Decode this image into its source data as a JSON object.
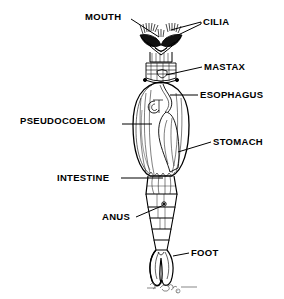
{
  "figure": {
    "style": "black and white line drawing",
    "line_color": "#000000",
    "background_color": "#ffffff",
    "signature": {
      "present": true,
      "text": "cursive artist signature",
      "symbol": "©"
    }
  },
  "labels": {
    "mouth": "MOUTH",
    "cilia": "CILIA",
    "mastax": "MASTAX",
    "esophagus": "ESOPHAGUS",
    "pseudocoelom": "PSEUDOCOELOM",
    "stomach": "STOMACH",
    "intestine": "INTESTINE",
    "anus": "ANUS",
    "foot": "FOOT"
  },
  "parts": [
    {
      "id": "mouth",
      "label": "MOUTH",
      "label_x": 85,
      "label_y": 12,
      "anchor_x": 158,
      "anchor_y": 36
    },
    {
      "id": "cilia",
      "label": "CILIA",
      "label_x": 203,
      "label_y": 17,
      "anchor_x": 168,
      "anchor_y": 33
    },
    {
      "id": "mastax",
      "label": "MASTAX",
      "label_x": 204,
      "label_y": 62,
      "anchor_x": 168,
      "anchor_y": 72
    },
    {
      "id": "esophagus",
      "label": "ESOPHAGUS",
      "label_x": 200,
      "label_y": 90,
      "anchor_x": 172,
      "anchor_y": 99
    },
    {
      "id": "pseudocoelom",
      "label": "PSEUDOCOELOM",
      "label_x": 20,
      "label_y": 116,
      "anchor_x": 150,
      "anchor_y": 124
    },
    {
      "id": "stomach",
      "label": "STOMACH",
      "label_x": 213,
      "label_y": 137,
      "anchor_x": 175,
      "anchor_y": 148
    },
    {
      "id": "intestine",
      "label": "INTESTINE",
      "label_x": 57,
      "label_y": 173,
      "anchor_x": 163,
      "anchor_y": 182
    },
    {
      "id": "anus",
      "label": "ANUS",
      "label_x": 102,
      "label_y": 212,
      "anchor_x": 164,
      "anchor_y": 205
    },
    {
      "id": "foot",
      "label": "FOOT",
      "label_x": 191,
      "label_y": 248,
      "anchor_x": 176,
      "anchor_y": 256
    }
  ]
}
